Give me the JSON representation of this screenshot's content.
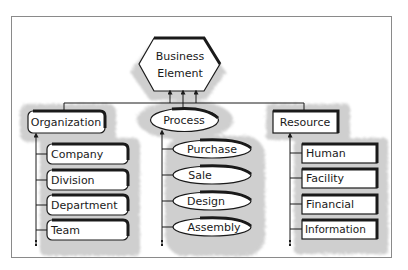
{
  "diagram": {
    "root": {
      "line1": "Business",
      "line2": "Element",
      "shape": "hexagon"
    },
    "categories": [
      {
        "label": "Organization",
        "shape": "rounded-rectangle",
        "children": [
          "Company",
          "Division",
          "Department",
          "Team"
        ]
      },
      {
        "label": "Process",
        "shape": "ellipse",
        "children": [
          "Purchase",
          "Sale",
          "Design",
          "Assembly"
        ]
      },
      {
        "label": "Resource",
        "shape": "rectangle",
        "children": [
          "Human",
          "Facility",
          "Financial",
          "Information"
        ]
      }
    ],
    "colors": {
      "stroke": "#1a1a1a",
      "shadow": "#9a9a9a",
      "frame": "#8a8a8a",
      "background": "#ffffff"
    }
  }
}
